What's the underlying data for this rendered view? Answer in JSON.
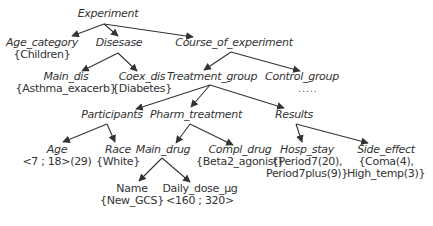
{
  "diagram": {
    "type": "tree",
    "edge_color": "#333333",
    "nodes": {
      "experiment": {
        "label": "Experiment"
      },
      "age_category": {
        "label": "Age_category",
        "value": "{Children}"
      },
      "disease": {
        "label": "Disesase"
      },
      "course_of_experiment": {
        "label": "Course_of_experiment"
      },
      "main_dis": {
        "label": "Main_dis",
        "value": "{Asthma_exacerb}"
      },
      "coex_dis": {
        "label": "Coex_dis",
        "value": "{Diabetes}"
      },
      "treatment_group": {
        "label": "Treatment_group"
      },
      "control_group": {
        "label": "Control_group",
        "ellipsis": "....."
      },
      "participants": {
        "label": "Participants"
      },
      "pharm_treatment": {
        "label": "Pharm_treatment"
      },
      "results": {
        "label": "Results"
      },
      "age": {
        "label": "Age",
        "value": "<7 ; 18>(29)"
      },
      "race": {
        "label": "Race",
        "value": "{White}"
      },
      "main_drug": {
        "label": "Main_drug"
      },
      "compl_drug": {
        "label": "Compl_drug",
        "value": "{Beta2_agonist}"
      },
      "hosp_stay": {
        "label": "Hosp_stay",
        "value": "{Period7(20),",
        "value2": "Period7plus(9)}"
      },
      "side_effect": {
        "label": "Side_effect",
        "value": "{Coma(4),",
        "value2": "High_temp(3)}"
      },
      "name": {
        "label": "Name",
        "value": "{New_GCS}"
      },
      "daily_dose": {
        "label": "Daily_dose_µg",
        "value": "<160 ; 320>"
      }
    },
    "edges": [
      [
        "experiment",
        "age_category"
      ],
      [
        "experiment",
        "disease"
      ],
      [
        "experiment",
        "course_of_experiment"
      ],
      [
        "disease",
        "main_dis"
      ],
      [
        "disease",
        "coex_dis"
      ],
      [
        "course_of_experiment",
        "treatment_group"
      ],
      [
        "course_of_experiment",
        "control_group"
      ],
      [
        "treatment_group",
        "participants"
      ],
      [
        "treatment_group",
        "pharm_treatment"
      ],
      [
        "treatment_group",
        "results"
      ],
      [
        "participants",
        "age"
      ],
      [
        "participants",
        "race"
      ],
      [
        "pharm_treatment",
        "main_drug"
      ],
      [
        "pharm_treatment",
        "compl_drug"
      ],
      [
        "results",
        "hosp_stay"
      ],
      [
        "results",
        "side_effect"
      ],
      [
        "main_drug",
        "name"
      ],
      [
        "main_drug",
        "daily_dose"
      ]
    ]
  }
}
